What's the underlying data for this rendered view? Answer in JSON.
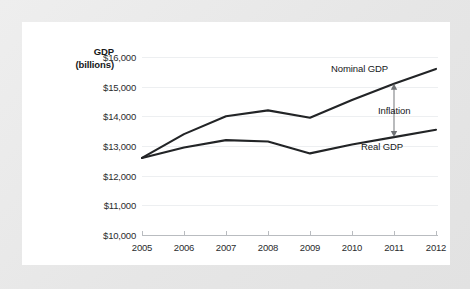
{
  "chart_data": {
    "type": "line",
    "title": "",
    "subtitle": "",
    "ylabel_line1": "GDP",
    "ylabel_line2": "(billions)",
    "xlabel": "",
    "categories": [
      "2005",
      "2006",
      "2007",
      "2008",
      "2009",
      "2010",
      "2011",
      "2012"
    ],
    "ylim": [
      10000,
      16000
    ],
    "ytick_labels": [
      "$16,000",
      "$15,000",
      "$14,000",
      "$13,000",
      "$12,000",
      "$11,000",
      "$10,000"
    ],
    "ytick_values": [
      16000,
      15000,
      14000,
      13000,
      12000,
      11000,
      10000
    ],
    "grid": true,
    "legend_position": "inline-annotations",
    "series": [
      {
        "name": "Nominal GDP",
        "color": "#222426",
        "values": [
          12600,
          13400,
          14000,
          14200,
          13950,
          14550,
          15100,
          15600
        ]
      },
      {
        "name": "Real GDP",
        "color": "#222426",
        "values": [
          12600,
          12950,
          13200,
          13150,
          12750,
          13050,
          13300,
          13550
        ]
      }
    ],
    "annotations": [
      {
        "name": "Inflation",
        "label": "Inflation",
        "type": "double-arrow",
        "at_category": "2011",
        "from_value": 13300,
        "to_value": 15100,
        "color": "#8a8d90"
      }
    ]
  }
}
